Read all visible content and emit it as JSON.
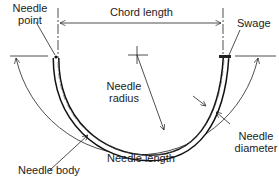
{
  "diagram": {
    "type": "surgical-needle-anatomy",
    "labels": {
      "needle_point": [
        "Needle",
        "point"
      ],
      "chord_length": "Chord length",
      "swage": "Swage",
      "needle_radius": [
        "Needle",
        "radius"
      ],
      "needle_body": "Needle body",
      "needle_length": "Needle length",
      "needle_diameter": [
        "Needle",
        "diameter"
      ]
    },
    "colors": {
      "line": "#222222",
      "background": "#ffffff"
    }
  }
}
